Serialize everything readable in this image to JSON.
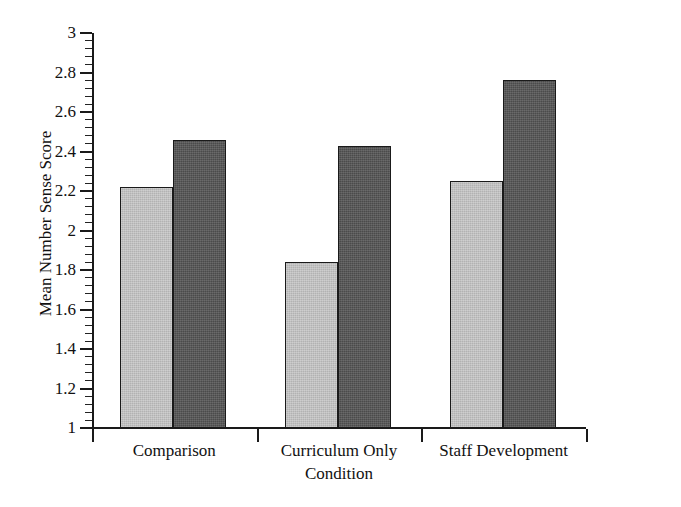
{
  "chart_data": {
    "type": "bar",
    "title": "",
    "subtitle": "",
    "xlabel": "Condition",
    "ylabel": "Mean Number Sense Score",
    "categories": [
      "Comparison",
      "Curriculum Only",
      "Staff Development"
    ],
    "series": [
      {
        "name": "light-series",
        "values": [
          2.22,
          1.84,
          2.25
        ],
        "color": "#b2b2b2"
      },
      {
        "name": "dark-series",
        "values": [
          2.46,
          2.43,
          2.76
        ],
        "color": "#4b4b4b"
      }
    ],
    "ylim": [
      1,
      3
    ],
    "ytick_labels": [
      "1",
      "1.2",
      "1.4",
      "1.6",
      "1.8",
      "2",
      "2.2",
      "2.4",
      "2.6",
      "2.8",
      "3"
    ],
    "ytick_values": [
      1,
      1.2,
      1.4,
      1.6,
      1.8,
      2,
      2.2,
      2.4,
      2.6,
      2.8,
      3
    ],
    "y_minor_tick_step": 0.04,
    "grid": false,
    "legend": "none",
    "legend_position": "none",
    "annotations": [],
    "axis_color": "#1a1a1a",
    "background_color": "#ffffff"
  },
  "axes": {
    "y_title": "Mean Number Sense Score",
    "x_title": "Condition"
  },
  "ticks": {
    "y": [
      {
        "label": "3"
      },
      {
        "label": "2.8"
      },
      {
        "label": "2.6"
      },
      {
        "label": "2.4"
      },
      {
        "label": "2.2"
      },
      {
        "label": "2"
      },
      {
        "label": "1.8"
      },
      {
        "label": "1.6"
      },
      {
        "label": "1.4"
      },
      {
        "label": "1.2"
      },
      {
        "label": "1"
      }
    ],
    "x": [
      {
        "label": "Comparison"
      },
      {
        "label": "Curriculum Only"
      },
      {
        "label": "Staff Development"
      }
    ]
  }
}
